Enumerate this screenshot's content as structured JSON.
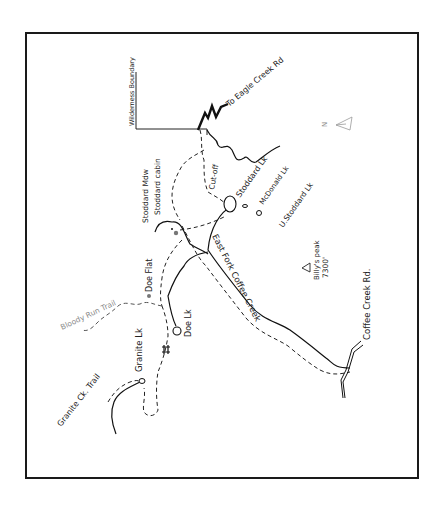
{
  "map": {
    "north_indicator": "N",
    "labels": {
      "wilderness_boundary": "Wilderness Boundary",
      "eagle_creek_rd": "To Eagle Creek Rd",
      "stoddard_mdw": "Stoddard Mdw",
      "stoddard_cabin": "Stoddard cabin",
      "cut_off": "Cut-off",
      "stoddard_lk": "Stoddard Lk",
      "mcdonald_lk": "McDonald Lk",
      "u_stoddard_lk": "U.Stoddard Lk",
      "billys_peak": "Billy's peak",
      "billys_peak_elev": "7300'",
      "east_fork_coffee_creek": "East Fork Coffee Creek",
      "coffee_creek_rd": "Coffee Creek Rd.",
      "doe_flat": "Doe Flat",
      "bloody_run_trail": "Bloody Run Trail",
      "doe_lk": "Doe Lk",
      "granite_lk": "Granite Lk",
      "granite_ck_trail": "Granite Ck. Trail"
    },
    "colors": {
      "ink": "#111111",
      "grey_label": "#8a8a8a",
      "background": "#ffffff"
    }
  }
}
